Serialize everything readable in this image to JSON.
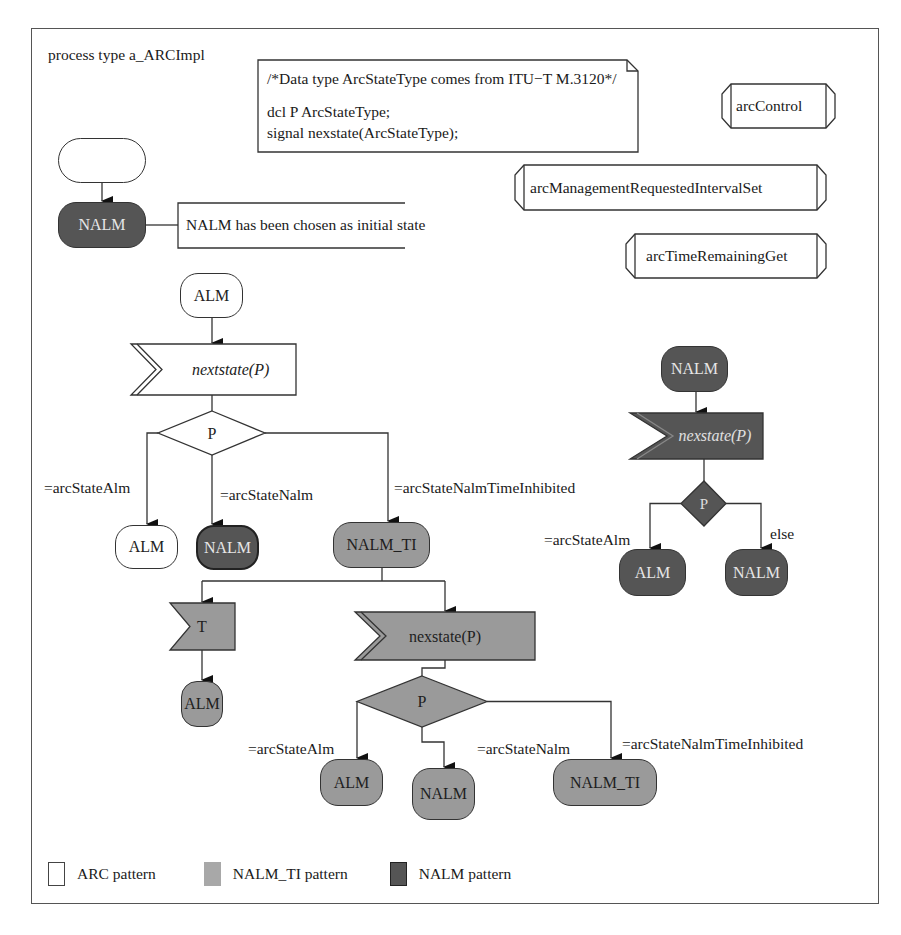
{
  "diagram": {
    "title": "process type a_ARCImpl",
    "declarations": {
      "comment": "/*Data type ArcStateType comes from ITU−T M.3120*/",
      "dcl": "dcl P ArcStateType;",
      "signal": "signal nexstate(ArcStateType);"
    },
    "procedures": [
      {
        "label": "arcControl"
      },
      {
        "label": "arcManagementRequestedIntervalSet"
      },
      {
        "label": "arcTimeRemainingGet"
      }
    ],
    "initial": {
      "start_label": "",
      "state": "NALM",
      "comment": "NALM has been chosen as initial state"
    },
    "alm_branch": {
      "state": "ALM",
      "input": "nextstate(P)",
      "decision": "P",
      "answers": [
        "=arcStateAlm",
        "=arcStateNalm",
        "=arcStateNalmTimeInhibited"
      ],
      "next_states": [
        "ALM",
        "NALM",
        "NALM_TI"
      ]
    },
    "nalm_ti_branch": {
      "timer_input": "T",
      "timer_next_state": "ALM",
      "input": "nexstate(P)",
      "decision": "P",
      "answers": [
        "=arcStateAlm",
        "=arcStateNalm",
        "=arcStateNalmTimeInhibited"
      ],
      "next_states": [
        "ALM",
        "NALM",
        "NALM_TI"
      ]
    },
    "nalm_branch": {
      "state": "NALM",
      "input": "nexstate(P)",
      "decision": "P",
      "answers": [
        "=arcStateAlm",
        "else"
      ],
      "next_states": [
        "ALM",
        "NALM"
      ]
    },
    "legend": [
      {
        "label": "ARC pattern",
        "color": "#ffffff"
      },
      {
        "label": "NALM_TI pattern",
        "color": "#a8a8a8"
      },
      {
        "label": "NALM pattern",
        "color": "#555555"
      }
    ],
    "colors": {
      "arc": "#ffffff",
      "nalm_ti": "#9a9a9a",
      "nalm": "#555555",
      "line": "#333333"
    }
  }
}
